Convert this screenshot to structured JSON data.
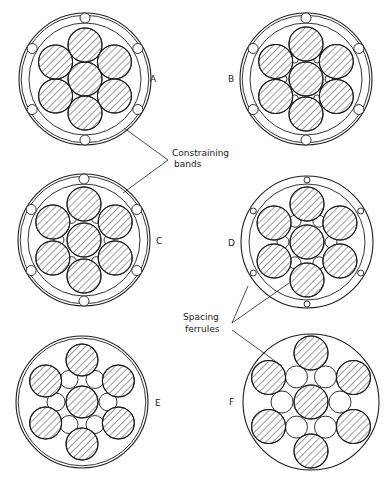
{
  "figure": {
    "ink_color": "#1e1e1e",
    "background": "#ffffff"
  },
  "panels": [
    {
      "id": "A",
      "label": "A",
      "cx": 85,
      "cy": 79,
      "outer_r": 66,
      "outer_double": true,
      "inner_r": 56,
      "rod_r": 17,
      "rod_ring": 34,
      "outer_ferrule_r": 5,
      "outer_ferrule_ring": 61,
      "outer_ferrule_count": 6,
      "inner_ferrule_r": 0,
      "inner_ferrule_count": 0,
      "label_x": 150,
      "label_y": 82
    },
    {
      "id": "B",
      "label": "B",
      "cx": 306,
      "cy": 79,
      "outer_r": 66,
      "outer_double": true,
      "inner_r": 56,
      "rod_r": 17,
      "rod_ring": 35,
      "outer_ferrule_r": 5,
      "outer_ferrule_ring": 61,
      "outer_ferrule_count": 6,
      "inner_ferrule_r": 4,
      "inner_ferrule_ring": 23,
      "inner_ferrule_count": 6,
      "label_x": 228,
      "label_y": 82
    },
    {
      "id": "C",
      "label": "C",
      "cx": 84,
      "cy": 240,
      "outer_r": 66,
      "outer_double": true,
      "inner_r": 56,
      "rod_r": 17,
      "rod_ring": 36,
      "outer_ferrule_r": 5,
      "outer_ferrule_ring": 61,
      "outer_ferrule_count": 6,
      "inner_ferrule_r": 5,
      "inner_ferrule_ring": 25,
      "inner_ferrule_count": 6,
      "label_x": 156,
      "label_y": 244
    },
    {
      "id": "D",
      "label": "D",
      "cx": 307,
      "cy": 242,
      "outer_r": 66,
      "outer_double": false,
      "inner_r": 58,
      "rod_r": 17,
      "rod_ring": 38,
      "outer_ferrule_r": 3,
      "outer_ferrule_ring": 62,
      "outer_ferrule_count": 6,
      "inner_ferrule_r": 6,
      "inner_ferrule_ring": 24,
      "inner_ferrule_count": 6,
      "label_x": 228,
      "label_y": 246
    },
    {
      "id": "E",
      "label": "E",
      "cx": 82,
      "cy": 402,
      "outer_r": 66,
      "outer_double": true,
      "inner_r": 0,
      "rod_r": 16,
      "rod_ring": 42,
      "outer_ferrule_r": 0,
      "outer_ferrule_count": 0,
      "inner_ferrule_r": 9,
      "inner_ferrule_ring": 26,
      "inner_ferrule_count": 6,
      "label_x": 155,
      "label_y": 406
    },
    {
      "id": "F",
      "label": "F",
      "cx": 311,
      "cy": 402,
      "outer_r": 68,
      "outer_double": false,
      "inner_r": 0,
      "rod_r": 17,
      "rod_ring": 49,
      "outer_ferrule_r": 0,
      "outer_ferrule_count": 0,
      "inner_ferrule_r": 11,
      "inner_ferrule_ring": 29,
      "inner_ferrule_count": 6,
      "label_x": 229,
      "label_y": 405
    }
  ],
  "annotations": {
    "constraining_bands": {
      "line1": "Constraining",
      "line2": "bands",
      "x": 172,
      "y1": 156,
      "y2": 167,
      "leaders": [
        {
          "x1": 168,
          "y1": 160,
          "x2": 124,
          "y2": 128
        },
        {
          "x1": 168,
          "y1": 160,
          "x2": 123,
          "y2": 193
        }
      ]
    },
    "spacing_ferrules": {
      "line1": "Spacing",
      "line2": "ferrules",
      "x": 183,
      "y1": 320,
      "y2": 332,
      "leaders": [
        {
          "x1": 232,
          "y1": 323,
          "x2": 248,
          "y2": 286
        },
        {
          "x1": 232,
          "y1": 323,
          "x2": 289,
          "y2": 283
        },
        {
          "x1": 232,
          "y1": 330,
          "x2": 282,
          "y2": 366
        }
      ]
    }
  }
}
